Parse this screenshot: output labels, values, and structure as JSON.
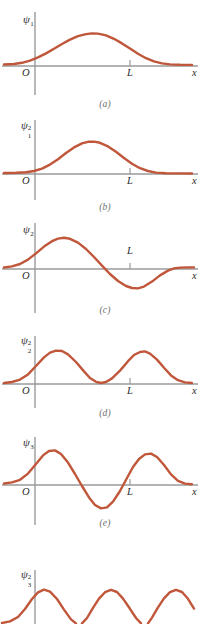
{
  "figure": {
    "curve_color": "#c0563a",
    "axis_color": "#9a9a9a",
    "text_color": "#2b2b2b",
    "caption_color": "#6d6d6d",
    "background": "#ffffff"
  },
  "common_labels": {
    "origin": "O",
    "x_axis": "x",
    "box_edge": "L",
    "psi_symbol": "ψ"
  },
  "panels": [
    {
      "id": "a",
      "caption": "(a)",
      "y_label_symbol": "ψ",
      "y_label_sub": "1",
      "y_label_sup": "",
      "y_label_text": "ψ₁",
      "origin_label": "O",
      "x_label": "x",
      "L_label": "L",
      "quantum_number": 1,
      "kind": "wavefunction",
      "lobes": [
        "+"
      ]
    },
    {
      "id": "b",
      "caption": "(b)",
      "y_label_symbol": "ψ",
      "y_label_sub": "1",
      "y_label_sup": "2",
      "y_label_text": "ψ₁²",
      "origin_label": "O",
      "x_label": "x",
      "L_label": "L",
      "quantum_number": 1,
      "kind": "probability-density",
      "lobes": [
        "+"
      ]
    },
    {
      "id": "c",
      "caption": "(c)",
      "y_label_symbol": "ψ",
      "y_label_sub": "2",
      "y_label_sup": "",
      "y_label_text": "ψ₂",
      "origin_label": "O",
      "x_label": "x",
      "L_label": "L",
      "quantum_number": 2,
      "kind": "wavefunction",
      "lobes": [
        "+",
        "-"
      ]
    },
    {
      "id": "d",
      "caption": "(d)",
      "y_label_symbol": "ψ",
      "y_label_sub": "2",
      "y_label_sup": "2",
      "y_label_text": "ψ₂²",
      "origin_label": "O",
      "x_label": "x",
      "L_label": "L",
      "quantum_number": 2,
      "kind": "probability-density",
      "lobes": [
        "+",
        "+"
      ]
    },
    {
      "id": "e",
      "caption": "(e)",
      "y_label_symbol": "ψ",
      "y_label_sub": "3",
      "y_label_sup": "",
      "y_label_text": "ψ₃",
      "origin_label": "O",
      "x_label": "x",
      "L_label": "L",
      "quantum_number": 3,
      "kind": "wavefunction",
      "lobes": [
        "+",
        "-",
        "+"
      ]
    },
    {
      "id": "f",
      "caption": "",
      "y_label_symbol": "ψ",
      "y_label_sub": "3",
      "y_label_sup": "2",
      "y_label_text": "ψ₃²",
      "origin_label": "",
      "x_label": "",
      "L_label": "",
      "quantum_number": 3,
      "kind": "probability-density",
      "lobes": [
        "+",
        "+",
        "+"
      ]
    }
  ]
}
